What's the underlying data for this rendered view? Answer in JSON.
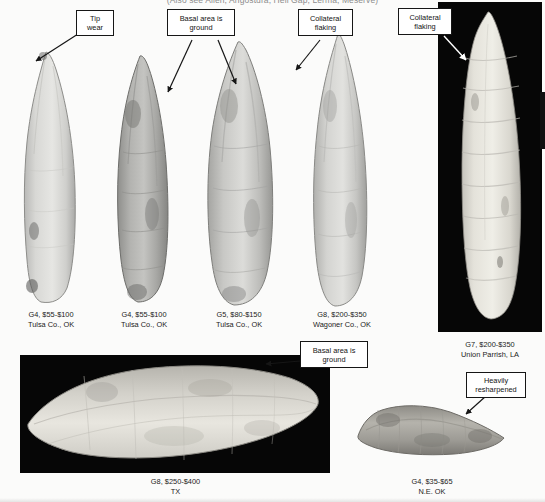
{
  "page": {
    "header_text": "(Also see Allen, Angostura, Hell Gap, Lerma, Meserve)",
    "background_color": "#fbfbfa",
    "photo_background_color": "#060606"
  },
  "callouts": [
    {
      "id": "tip-wear",
      "lines": [
        "Tip",
        "wear"
      ]
    },
    {
      "id": "basal-ground-top",
      "lines": [
        "Basal area is",
        "ground"
      ]
    },
    {
      "id": "collateral-flaking-1",
      "lines": [
        "Collateral",
        "flaking"
      ]
    },
    {
      "id": "collateral-flaking-2",
      "lines": [
        "Collateral",
        "flaking"
      ]
    },
    {
      "id": "basal-ground-bottom",
      "lines": [
        "Basal area is",
        "ground"
      ]
    },
    {
      "id": "heavily-resharpened",
      "lines": [
        "Heavily",
        "resharpened"
      ]
    }
  ],
  "artifacts": [
    {
      "id": "point-1",
      "grade_price": "G4, $55-$100",
      "provenance": "Tulsa Co., OK"
    },
    {
      "id": "point-2",
      "grade_price": "G4, $55-$100",
      "provenance": "Tulsa Co., OK"
    },
    {
      "id": "point-3",
      "grade_price": "G5, $80-$150",
      "provenance": "Tulsa Co., OK"
    },
    {
      "id": "point-4",
      "grade_price": "G8, $200-$350",
      "provenance": "Wagoner Co., OK"
    },
    {
      "id": "point-5",
      "grade_price": "G7, $200-$350",
      "provenance": "Union Parrish, LA"
    },
    {
      "id": "point-6",
      "grade_price": "G8, $250-$400",
      "provenance": "TX"
    },
    {
      "id": "point-7",
      "grade_price": "G4, $35-$65",
      "provenance": "N.E. OK"
    }
  ]
}
